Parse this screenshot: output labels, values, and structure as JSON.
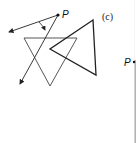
{
  "figure": {
    "panel_label": "(c)",
    "point_label": "P",
    "right_point_label": "P",
    "colors": {
      "stroke": "#222222",
      "background": "#ffffff",
      "right_line": "#666666"
    }
  }
}
